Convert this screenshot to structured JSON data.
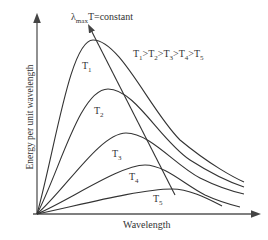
{
  "diagram": {
    "title_annotation": {
      "prefix": "λ",
      "sub": "max",
      "suffix": "T=constant"
    },
    "ordering": {
      "text": "T",
      "items": [
        "1",
        "2",
        "3",
        "4",
        "5"
      ],
      "sep": ">"
    },
    "xlabel": "Wavelength",
    "ylabel": "Energy per unit wavelength",
    "curves": [
      {
        "name": "T",
        "sub": "1",
        "peak": [
          93,
          40
        ]
      },
      {
        "name": "T",
        "sub": "2",
        "peak": [
          108,
          89
        ]
      },
      {
        "name": "T",
        "sub": "3",
        "peak": [
          126,
          133
        ]
      },
      {
        "name": "T",
        "sub": "4",
        "peak": [
          145,
          165
        ]
      },
      {
        "name": "T",
        "sub": "5",
        "peak": [
          172,
          189
        ]
      }
    ],
    "line_color": "#333333"
  }
}
